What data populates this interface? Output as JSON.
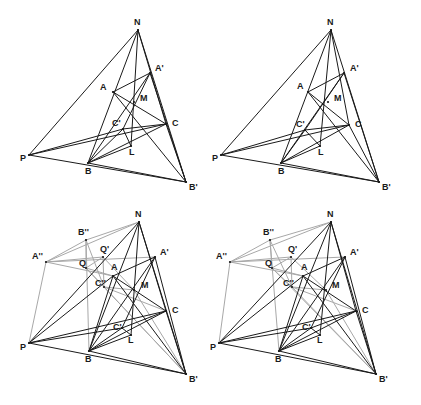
{
  "figure": {
    "background_color": "#ffffff",
    "line_color_primary": "#1a1a1a",
    "line_color_secondary": "#a8a8a8",
    "label_color": "#1a1a1a",
    "panel_count": 4
  },
  "panels": [
    {
      "id": "panel-top-left",
      "name": "Panel 1 - base configuration",
      "origin_x": 0,
      "origin_y": 0,
      "width": 210,
      "height": 202,
      "points": [
        {
          "key": "N",
          "label": "N",
          "x": 138,
          "y": 30,
          "lx": 134,
          "ly": 25
        },
        {
          "key": "A",
          "label": "A",
          "x": 113,
          "y": 92,
          "lx": 100,
          "ly": 90
        },
        {
          "key": "Ap",
          "label": "A'",
          "x": 150,
          "y": 73,
          "lx": 155,
          "ly": 71
        },
        {
          "key": "M",
          "label": "M",
          "x": 134,
          "y": 102,
          "lx": 140,
          "ly": 101
        },
        {
          "key": "C",
          "label": "C",
          "x": 166,
          "y": 124,
          "lx": 172,
          "ly": 126
        },
        {
          "key": "Cp",
          "label": "C'",
          "x": 123,
          "y": 129,
          "lx": 112,
          "ly": 126
        },
        {
          "key": "L",
          "label": "L",
          "x": 131,
          "y": 146,
          "lx": 129,
          "ly": 155
        },
        {
          "key": "P",
          "label": "P",
          "x": 29,
          "y": 155,
          "lx": 20,
          "ly": 161
        },
        {
          "key": "B",
          "label": "B",
          "x": 88,
          "y": 163,
          "lx": 85,
          "ly": 174
        },
        {
          "key": "Bp",
          "label": "B'",
          "x": 186,
          "y": 182,
          "lx": 189,
          "ly": 190
        }
      ],
      "segments_black": [
        [
          "N",
          "P"
        ],
        [
          "N",
          "Bp"
        ],
        [
          "N",
          "B"
        ],
        [
          "N",
          "L"
        ],
        [
          "N",
          "C"
        ],
        [
          "P",
          "Bp"
        ],
        [
          "P",
          "C"
        ],
        [
          "P",
          "Cp"
        ],
        [
          "A",
          "Ap"
        ],
        [
          "A",
          "C"
        ],
        [
          "A",
          "Bp"
        ],
        [
          "Ap",
          "B"
        ],
        [
          "Ap",
          "Bp"
        ],
        [
          "Ap",
          "Cp"
        ],
        [
          "C",
          "Cp"
        ],
        [
          "C",
          "B"
        ],
        [
          "C",
          "Bp"
        ],
        [
          "Cp",
          "L"
        ],
        [
          "Cp",
          "B"
        ],
        [
          "B",
          "Bp"
        ],
        [
          "L",
          "B"
        ]
      ],
      "segments_grey": []
    },
    {
      "id": "panel-top-right",
      "name": "Panel 2 - base configuration variant",
      "origin_x": 210,
      "origin_y": 0,
      "width": 211,
      "height": 202,
      "points": [
        {
          "key": "N",
          "label": "N",
          "x": 331,
          "y": 30,
          "lx": 327,
          "ly": 25
        },
        {
          "key": "A",
          "label": "A",
          "x": 308,
          "y": 92,
          "lx": 297,
          "ly": 89
        },
        {
          "key": "Ap",
          "label": "A'",
          "x": 344,
          "y": 73,
          "lx": 350,
          "ly": 71
        },
        {
          "key": "M",
          "label": "M",
          "x": 328,
          "y": 102,
          "lx": 334,
          "ly": 101
        },
        {
          "key": "C",
          "label": "C",
          "x": 349,
          "y": 125,
          "lx": 355,
          "ly": 127
        },
        {
          "key": "Cp",
          "label": "C'",
          "x": 305,
          "y": 130,
          "lx": 296,
          "ly": 127
        },
        {
          "key": "L",
          "label": "L",
          "x": 320,
          "y": 146,
          "lx": 318,
          "ly": 155
        },
        {
          "key": "P",
          "label": "P",
          "x": 221,
          "y": 155,
          "lx": 212,
          "ly": 161
        },
        {
          "key": "B",
          "label": "B",
          "x": 281,
          "y": 163,
          "lx": 278,
          "ly": 174
        },
        {
          "key": "Bp",
          "label": "B'",
          "x": 379,
          "y": 182,
          "lx": 382,
          "ly": 190
        }
      ],
      "segments_black": [
        [
          "N",
          "P"
        ],
        [
          "N",
          "Bp"
        ],
        [
          "N",
          "B"
        ],
        [
          "N",
          "L"
        ],
        [
          "N",
          "C"
        ],
        [
          "P",
          "Bp"
        ],
        [
          "P",
          "C"
        ],
        [
          "P",
          "Cp"
        ],
        [
          "A",
          "Ap"
        ],
        [
          "A",
          "C"
        ],
        [
          "A",
          "Bp"
        ],
        [
          "Ap",
          "B"
        ],
        [
          "Ap",
          "Bp"
        ],
        [
          "Ap",
          "Cp"
        ],
        [
          "C",
          "Cp"
        ],
        [
          "C",
          "B"
        ],
        [
          "C",
          "Bp"
        ],
        [
          "Cp",
          "L"
        ],
        [
          "Cp",
          "B"
        ],
        [
          "B",
          "Bp"
        ],
        [
          "L",
          "B"
        ]
      ],
      "segments_grey": []
    },
    {
      "id": "panel-bottom-left",
      "name": "Panel 3 - extended configuration",
      "origin_x": 0,
      "origin_y": 205,
      "width": 210,
      "height": 200,
      "points": [
        {
          "key": "N",
          "label": "N",
          "x": 139,
          "y": 222,
          "lx": 135,
          "ly": 217
        },
        {
          "key": "Bpp",
          "label": "B''",
          "x": 86,
          "y": 240,
          "lx": 78,
          "ly": 235
        },
        {
          "key": "App",
          "label": "A''",
          "x": 46,
          "y": 262,
          "lx": 32,
          "ly": 259
        },
        {
          "key": "Qp",
          "label": "Q'",
          "x": 103,
          "y": 257,
          "lx": 100,
          "ly": 252
        },
        {
          "key": "Ap",
          "label": "A'",
          "x": 155,
          "y": 257,
          "lx": 160,
          "ly": 255
        },
        {
          "key": "Q",
          "label": "Q",
          "x": 86,
          "y": 268,
          "lx": 79,
          "ly": 266
        },
        {
          "key": "A",
          "label": "A",
          "x": 113,
          "y": 276,
          "lx": 111,
          "ly": 270
        },
        {
          "key": "Cpp",
          "label": "C''",
          "x": 104,
          "y": 287,
          "lx": 95,
          "ly": 286
        },
        {
          "key": "M",
          "label": "M",
          "x": 134,
          "y": 290,
          "lx": 141,
          "ly": 288
        },
        {
          "key": "C",
          "label": "C",
          "x": 166,
          "y": 311,
          "lx": 172,
          "ly": 313
        },
        {
          "key": "Cp",
          "label": "C'",
          "x": 122,
          "y": 328,
          "lx": 113,
          "ly": 330
        },
        {
          "key": "L",
          "label": "L",
          "x": 131,
          "y": 335,
          "lx": 128,
          "ly": 343
        },
        {
          "key": "P",
          "label": "P",
          "x": 29,
          "y": 343,
          "lx": 20,
          "ly": 350
        },
        {
          "key": "B",
          "label": "B",
          "x": 89,
          "y": 351,
          "lx": 85,
          "ly": 362
        },
        {
          "key": "Bp",
          "label": "B'",
          "x": 186,
          "y": 374,
          "lx": 189,
          "ly": 382
        }
      ],
      "segments_black": [
        [
          "N",
          "P"
        ],
        [
          "N",
          "Bp"
        ],
        [
          "N",
          "B"
        ],
        [
          "N",
          "L"
        ],
        [
          "N",
          "C"
        ],
        [
          "P",
          "Bp"
        ],
        [
          "P",
          "C"
        ],
        [
          "P",
          "Cp"
        ],
        [
          "P",
          "A"
        ],
        [
          "A",
          "Ap"
        ],
        [
          "A",
          "C"
        ],
        [
          "A",
          "Bp"
        ],
        [
          "A",
          "B"
        ],
        [
          "Ap",
          "B"
        ],
        [
          "Ap",
          "Bp"
        ],
        [
          "Ap",
          "Cp"
        ],
        [
          "C",
          "Cp"
        ],
        [
          "C",
          "B"
        ],
        [
          "C",
          "Bp"
        ],
        [
          "Cp",
          "L"
        ],
        [
          "Cp",
          "B"
        ],
        [
          "B",
          "Bp"
        ],
        [
          "L",
          "B"
        ]
      ],
      "segments_grey": [
        [
          "App",
          "Bpp"
        ],
        [
          "App",
          "Qp"
        ],
        [
          "App",
          "Ap"
        ],
        [
          "App",
          "A"
        ],
        [
          "App",
          "P"
        ],
        [
          "Bpp",
          "N"
        ],
        [
          "Bpp",
          "Q"
        ],
        [
          "Bpp",
          "B"
        ],
        [
          "Bpp",
          "Cpp"
        ],
        [
          "Qp",
          "Q"
        ],
        [
          "Qp",
          "Cpp"
        ],
        [
          "Qp",
          "M"
        ],
        [
          "Q",
          "A"
        ],
        [
          "Q",
          "Cpp"
        ],
        [
          "Q",
          "Bp"
        ],
        [
          "Cpp",
          "C"
        ],
        [
          "Cpp",
          "M"
        ],
        [
          "Cpp",
          "Bp"
        ],
        [
          "N",
          "App"
        ],
        [
          "M",
          "Bp"
        ]
      ]
    },
    {
      "id": "panel-bottom-right",
      "name": "Panel 4 - extended configuration variant",
      "origin_x": 210,
      "origin_y": 205,
      "width": 211,
      "height": 200,
      "points": [
        {
          "key": "N",
          "label": "N",
          "x": 331,
          "y": 222,
          "lx": 327,
          "ly": 217
        },
        {
          "key": "Bpp",
          "label": "B''",
          "x": 270,
          "y": 240,
          "lx": 263,
          "ly": 235
        },
        {
          "key": "App",
          "label": "A''",
          "x": 230,
          "y": 262,
          "lx": 216,
          "ly": 259
        },
        {
          "key": "Qp",
          "label": "Q'",
          "x": 291,
          "y": 257,
          "lx": 288,
          "ly": 252
        },
        {
          "key": "Ap",
          "label": "A'",
          "x": 345,
          "y": 257,
          "lx": 350,
          "ly": 255
        },
        {
          "key": "Q",
          "label": "Q",
          "x": 272,
          "y": 268,
          "lx": 265,
          "ly": 266
        },
        {
          "key": "A",
          "label": "A",
          "x": 303,
          "y": 276,
          "lx": 301,
          "ly": 270
        },
        {
          "key": "Cpp",
          "label": "C''",
          "x": 292,
          "y": 287,
          "lx": 283,
          "ly": 286
        },
        {
          "key": "M",
          "label": "M",
          "x": 326,
          "y": 290,
          "lx": 332,
          "ly": 288
        },
        {
          "key": "C",
          "label": "C",
          "x": 356,
          "y": 311,
          "lx": 362,
          "ly": 313
        },
        {
          "key": "Cp",
          "label": "C'",
          "x": 311,
          "y": 328,
          "lx": 302,
          "ly": 330
        },
        {
          "key": "L",
          "label": "L",
          "x": 320,
          "y": 335,
          "lx": 317,
          "ly": 343
        },
        {
          "key": "P",
          "label": "P",
          "x": 219,
          "y": 343,
          "lx": 210,
          "ly": 350
        },
        {
          "key": "B",
          "label": "B",
          "x": 279,
          "y": 351,
          "lx": 275,
          "ly": 362
        },
        {
          "key": "Bp",
          "label": "B'",
          "x": 376,
          "y": 374,
          "lx": 379,
          "ly": 382
        }
      ],
      "segments_black": [
        [
          "N",
          "P"
        ],
        [
          "N",
          "Bp"
        ],
        [
          "N",
          "B"
        ],
        [
          "N",
          "L"
        ],
        [
          "N",
          "C"
        ],
        [
          "P",
          "Bp"
        ],
        [
          "P",
          "C"
        ],
        [
          "P",
          "Cp"
        ],
        [
          "P",
          "A"
        ],
        [
          "A",
          "Ap"
        ],
        [
          "A",
          "C"
        ],
        [
          "A",
          "Bp"
        ],
        [
          "A",
          "B"
        ],
        [
          "Ap",
          "B"
        ],
        [
          "Ap",
          "Bp"
        ],
        [
          "Ap",
          "Cp"
        ],
        [
          "C",
          "Cp"
        ],
        [
          "C",
          "B"
        ],
        [
          "C",
          "Bp"
        ],
        [
          "Cp",
          "L"
        ],
        [
          "Cp",
          "B"
        ],
        [
          "B",
          "Bp"
        ],
        [
          "L",
          "B"
        ]
      ],
      "segments_grey": [
        [
          "App",
          "Bpp"
        ],
        [
          "App",
          "Qp"
        ],
        [
          "App",
          "Ap"
        ],
        [
          "App",
          "A"
        ],
        [
          "App",
          "P"
        ],
        [
          "Bpp",
          "N"
        ],
        [
          "Bpp",
          "Q"
        ],
        [
          "Bpp",
          "B"
        ],
        [
          "Bpp",
          "Cpp"
        ],
        [
          "Qp",
          "Q"
        ],
        [
          "Qp",
          "Cpp"
        ],
        [
          "Qp",
          "M"
        ],
        [
          "Q",
          "A"
        ],
        [
          "Q",
          "Cpp"
        ],
        [
          "Q",
          "Bp"
        ],
        [
          "Cpp",
          "C"
        ],
        [
          "Cpp",
          "M"
        ],
        [
          "Cpp",
          "Bp"
        ],
        [
          "N",
          "App"
        ],
        [
          "M",
          "Bp"
        ]
      ]
    }
  ]
}
